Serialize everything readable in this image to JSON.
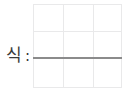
{
  "worksheet": {
    "label": {
      "text": "식",
      "colon": ":"
    },
    "grid": {
      "background_color": "#ffffff",
      "line_color": "#e9e9ea",
      "columns": 3,
      "rows": 3,
      "horizontal_line_offsets": [
        0,
        27,
        54,
        83
      ],
      "vertical_line_offsets": [
        0,
        30,
        60,
        88
      ]
    },
    "answer_rule": {
      "color": "#8b8b8b",
      "thickness": 2
    }
  }
}
